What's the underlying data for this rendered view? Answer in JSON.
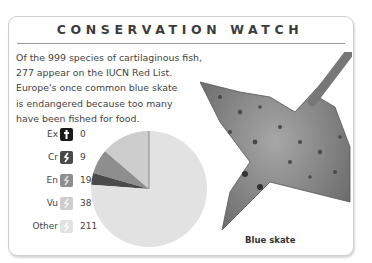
{
  "panel": {
    "title": "CONSERVATION WATCH",
    "intro_lines": [
      "Of the 999 species of cartilaginous fish,",
      "277 appear on the IUCN Red List.",
      "Europe's once common blue skate",
      "is endangered because too many",
      "have been fished for food."
    ],
    "legend": [
      {
        "label": "Ex",
        "icon": "dagger-icon",
        "value": "0",
        "color": "#1a1a1a"
      },
      {
        "label": "Cr",
        "icon": "fish-icon",
        "value": "9",
        "color": "#4a4a4a"
      },
      {
        "label": "En",
        "icon": "fish-icon",
        "value": "19",
        "color": "#8e8e8e"
      },
      {
        "label": "Vu",
        "icon": "fish-icon",
        "value": "38",
        "color": "#cdcdcd"
      },
      {
        "label": "Other",
        "icon": "fish-icon",
        "value": "211",
        "color": "#e2e2e2"
      }
    ],
    "image_caption": "Blue skate"
  },
  "chart_data": {
    "type": "pie",
    "title": "Conservation Watch",
    "categories": [
      "Ex",
      "Cr",
      "En",
      "Vu",
      "Other"
    ],
    "values": [
      0,
      9,
      19,
      38,
      211
    ],
    "total": 277,
    "colors": [
      "#1a1a1a",
      "#4a4a4a",
      "#8e8e8e",
      "#cdcdcd",
      "#e2e2e2"
    ],
    "start_angle": "12 o'clock, counterclockwise",
    "legend_position": "left"
  }
}
